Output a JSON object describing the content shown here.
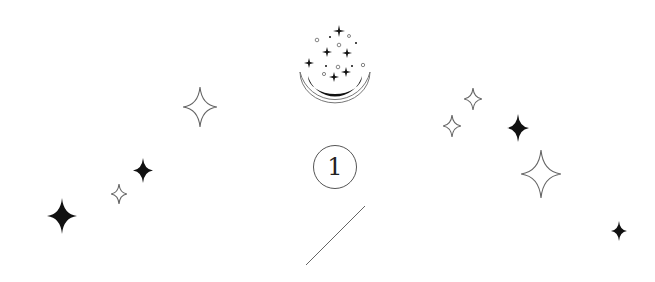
{
  "canvas": {
    "width": 655,
    "height": 282,
    "background": "#ffffff"
  },
  "emblem": {
    "icon": "crescent-moon-with-stars-icon",
    "color": "#111111"
  },
  "badge": {
    "number": "1",
    "border_color": "#555555"
  },
  "divider": {
    "type": "diagonal-line",
    "color": "#666666"
  },
  "stars": [
    {
      "style": "outline",
      "cx": 200,
      "cy": 107,
      "w": 34,
      "h": 40
    },
    {
      "style": "filled",
      "cx": 143,
      "cy": 170,
      "w": 20,
      "h": 25
    },
    {
      "style": "outline",
      "cx": 119,
      "cy": 194,
      "w": 16,
      "h": 20
    },
    {
      "style": "filled",
      "cx": 62,
      "cy": 216,
      "w": 30,
      "h": 36
    },
    {
      "style": "outline",
      "cx": 473,
      "cy": 99,
      "w": 18,
      "h": 22
    },
    {
      "style": "outline",
      "cx": 452,
      "cy": 126,
      "w": 18,
      "h": 22
    },
    {
      "style": "filled",
      "cx": 518,
      "cy": 128,
      "w": 22,
      "h": 28
    },
    {
      "style": "outline",
      "cx": 541,
      "cy": 174,
      "w": 40,
      "h": 48
    },
    {
      "style": "filled",
      "cx": 619,
      "cy": 231,
      "w": 16,
      "h": 20
    }
  ]
}
